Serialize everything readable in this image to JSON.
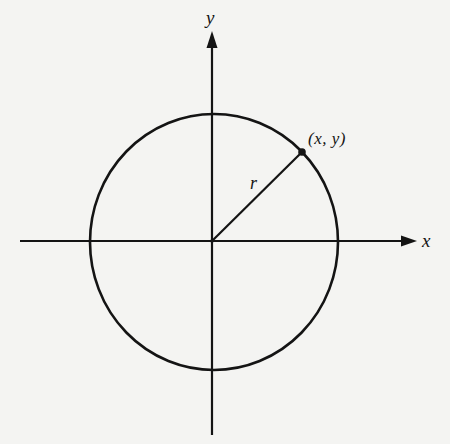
{
  "diagram": {
    "title": "",
    "axes": {
      "x_label": "x",
      "y_label": "y",
      "origin_px": [
        212,
        241
      ]
    },
    "circle": {
      "center_px": [
        213,
        242
      ],
      "radius_x_px": 124,
      "radius_y_px": 128
    },
    "point": {
      "label": "(x, y)",
      "position_px": [
        302,
        152
      ]
    },
    "radius_label": "r",
    "colors": {
      "ink": "#141414",
      "background": "#f4f4f2"
    }
  }
}
